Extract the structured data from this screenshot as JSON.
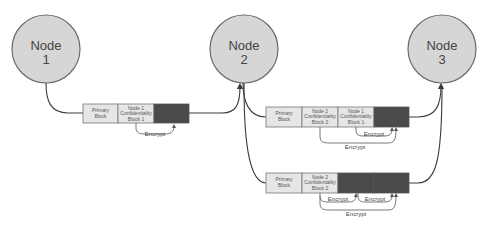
{
  "nodes": [
    {
      "id": "node1",
      "line1": "Node",
      "line2": "1"
    },
    {
      "id": "node2",
      "line1": "Node",
      "line2": "2"
    },
    {
      "id": "node3",
      "line1": "Node",
      "line2": "3"
    }
  ],
  "colors": {
    "node_fill": "#d6d6d6",
    "block_light": "#e6e6e6",
    "block_dark": "#4a4a4a",
    "edge": "#3a3a3a"
  },
  "messages": [
    {
      "from": "node1",
      "to": "node2",
      "blocks": [
        {
          "type": "light",
          "lines": [
            "Primary",
            "Block"
          ]
        },
        {
          "type": "light",
          "lines": [
            "Node 1",
            "Confidentiality",
            "Block 1"
          ]
        },
        {
          "type": "dark",
          "lines": []
        }
      ],
      "encrypt_labels": [
        "Encrypt"
      ]
    },
    {
      "from": "node2",
      "to": "node3",
      "blocks": [
        {
          "type": "light",
          "lines": [
            "Primary",
            "Block"
          ]
        },
        {
          "type": "light",
          "lines": [
            "Node 2",
            "Confidentiality",
            "Block 2"
          ]
        },
        {
          "type": "light",
          "lines": [
            "Node 1",
            "Confidentiality",
            "Block 1"
          ]
        },
        {
          "type": "dark",
          "lines": []
        }
      ],
      "encrypt_labels": [
        "Encrypt",
        "Encrypt"
      ]
    },
    {
      "from": "node2",
      "to": "node3",
      "blocks": [
        {
          "type": "light",
          "lines": [
            "Primary",
            "Block"
          ]
        },
        {
          "type": "light",
          "lines": [
            "Node 2",
            "Confidentiality",
            "Block 2"
          ]
        },
        {
          "type": "dark",
          "lines": []
        },
        {
          "type": "dark",
          "lines": []
        }
      ],
      "encrypt_labels": [
        "Encrypt",
        "Encrypt",
        "Encrypt"
      ]
    }
  ]
}
